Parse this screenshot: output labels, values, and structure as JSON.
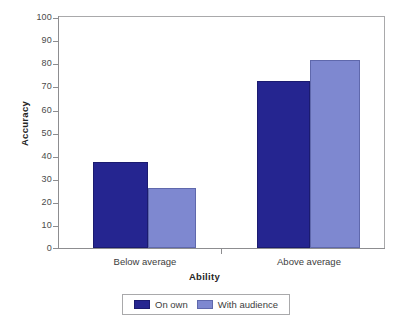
{
  "chart_data": {
    "type": "bar",
    "title": "",
    "subtitle": "",
    "xlabel": "Ability",
    "ylabel": "Accuracy",
    "categories": [
      "Below average",
      "Above average"
    ],
    "series": [
      {
        "name": "On own",
        "values": [
          37,
          72
        ],
        "color": "#252590"
      },
      {
        "name": "With audience",
        "values": [
          26,
          81
        ],
        "color": "#7e88d0"
      }
    ],
    "ylim": [
      0,
      100
    ],
    "yticks": [
      0,
      10,
      20,
      30,
      40,
      50,
      60,
      70,
      80,
      90,
      100
    ],
    "ytick_labels": [
      "0",
      "10",
      "20",
      "30",
      "40",
      "50",
      "60",
      "70",
      "80",
      "90",
      "100"
    ],
    "grid": false,
    "legend_position": "bottom",
    "bar_gap": "grouped-adjacent",
    "annotations": []
  },
  "axis": {
    "y": {
      "label": "Accuracy",
      "ticks": [
        "100",
        "90",
        "80",
        "70",
        "60",
        "50",
        "40",
        "30",
        "20",
        "10",
        "0"
      ]
    },
    "x": {
      "label": "Ability",
      "categories": [
        "Below average",
        "Above average"
      ]
    }
  },
  "legend": {
    "items": [
      {
        "label": "On own",
        "color": "#252590"
      },
      {
        "label": "With audience",
        "color": "#7e88d0"
      }
    ]
  },
  "colors": {
    "series_on_own": "#252590",
    "series_with_audience": "#7e88d0",
    "frame": "#a9a9ab",
    "background": "#ffffff",
    "text": "#3a3a3a"
  }
}
